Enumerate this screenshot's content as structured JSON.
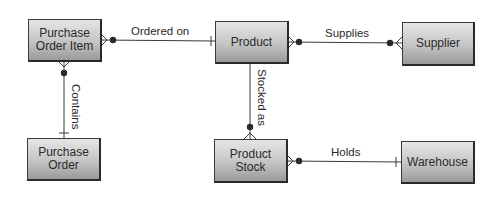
{
  "diagram": {
    "type": "entity-relationship",
    "entities": [
      {
        "id": "purchase_order_item",
        "label": "Purchase Order Item"
      },
      {
        "id": "product",
        "label": "Product"
      },
      {
        "id": "supplier",
        "label": "Supplier"
      },
      {
        "id": "purchase_order",
        "label": "Purchase Order"
      },
      {
        "id": "product_stock",
        "label": "Product Stock"
      },
      {
        "id": "warehouse",
        "label": "Warehouse"
      }
    ],
    "relationships": [
      {
        "label": "Ordered on",
        "from": "Purchase Order Item",
        "from_end": "zero-or-many",
        "to": "Product",
        "to_end": "one"
      },
      {
        "label": "Supplies",
        "from": "Product",
        "from_end": "zero-or-many",
        "to": "Supplier",
        "to_end": "zero-or-many"
      },
      {
        "label": "Contains",
        "from": "Purchase Order Item",
        "from_end": "zero-or-many",
        "to": "Purchase Order",
        "to_end": "one"
      },
      {
        "label": "Stocked as",
        "from": "Product",
        "from_end": "one",
        "to": "Product Stock",
        "to_end": "zero-or-many"
      },
      {
        "label": "Holds",
        "from": "Product Stock",
        "from_end": "zero-or-many",
        "to": "Warehouse",
        "to_end": "one"
      }
    ]
  },
  "colors": {
    "line": "#3a3a3a",
    "box_top": "#e6e6e6",
    "box_bottom": "#9a9a9a",
    "text": "#2a2a2a"
  }
}
